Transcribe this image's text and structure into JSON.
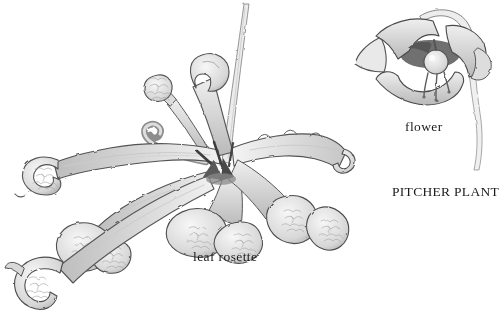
{
  "page": {
    "background_color": "#ffffff",
    "text_color": "#1b1b1b"
  },
  "figure": {
    "title": "PITCHER PLANT",
    "labels": {
      "flower": "flower",
      "leaf_rosette": "leaf rosette"
    },
    "illustrations": [
      {
        "name": "flower-illustration"
      },
      {
        "name": "leaf-rosette-illustration"
      }
    ],
    "palette": {
      "outline": "#4a4a4a",
      "shade_light": "#f3f3f3",
      "shade_mid": "#cbcbcb",
      "shade_dark": "#8e8e8e",
      "throat_dark": "#6f6f6f"
    }
  }
}
